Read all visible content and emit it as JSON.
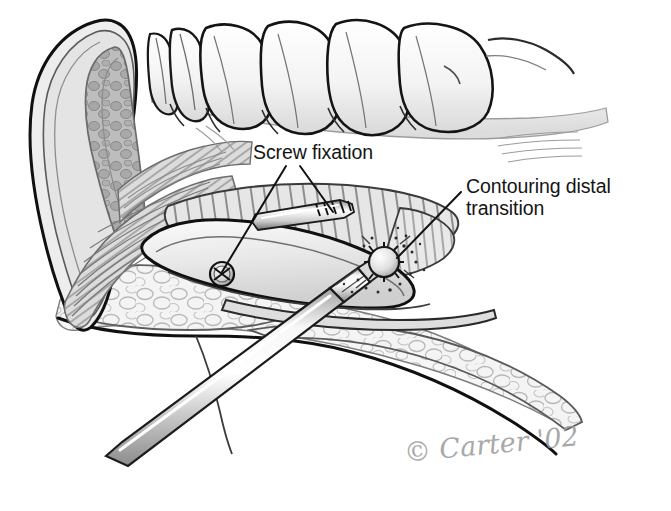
{
  "figure": {
    "background_color": "#ffffff",
    "ink_color": "#141414",
    "width": 671,
    "height": 511
  },
  "labels": [
    {
      "id": "screw-fixation",
      "text": "Screw fixation",
      "x": 253,
      "y": 142,
      "leaders": [
        {
          "from": [
            300,
            166
          ],
          "to": [
            333,
            212
          ]
        },
        {
          "from": [
            286,
            166
          ],
          "to": [
            222,
            272
          ]
        }
      ]
    },
    {
      "id": "contouring-distal-transition",
      "text": "Contouring distal\ntransition",
      "line1": "Contouring distal",
      "line2": "transition",
      "x": 466,
      "y": 176,
      "leaders": [
        {
          "from": [
            461,
            192
          ],
          "to": [
            397,
            258
          ]
        }
      ]
    }
  ],
  "signature": {
    "copyright_symbol": "©",
    "artist": "Carter",
    "year": "'02",
    "full": "© Carter '02",
    "color": "#9a9a9a"
  },
  "anatomy": {
    "teeth_count": 6,
    "structures": [
      "maxillary tooth row",
      "gingival margin",
      "coronoid process cross-section",
      "temporalis muscle fibers",
      "ramus bone graft with cortical hatching",
      "fatty soft tissue",
      "inferior border of mandible"
    ]
  },
  "instruments": [
    {
      "name": "fixation-screw",
      "type": "lag screw",
      "orientation": "horizontal through graft"
    },
    {
      "name": "screw-head",
      "type": "cross-slot screw head",
      "view": "face-on"
    },
    {
      "name": "surgical-handpiece",
      "type": "rotary handpiece with round bur",
      "orientation": "lower-left to upper-right"
    },
    {
      "name": "round-bur",
      "type": "spherical cutting bur",
      "debris": "bone spray particles"
    }
  ],
  "palette": {
    "outline_dark": "#141414",
    "outline_mid": "#4a4a4a",
    "outline_light": "#8e8e8e",
    "shade_light": "#ededed",
    "shade_mid": "#d6d6d6",
    "shade_deep": "#b4b4b4",
    "metal_light": "#f2f2f2",
    "metal_mid": "#c9c9c9"
  }
}
